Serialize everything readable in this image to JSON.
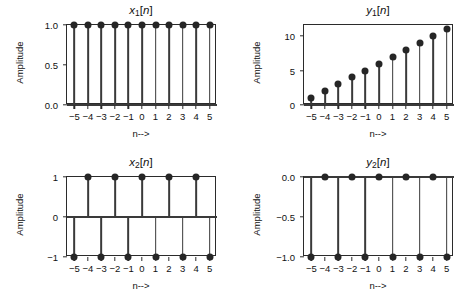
{
  "figure": {
    "width": 473,
    "height": 307,
    "background": "#ffffff",
    "line_color": "#3a3a3a",
    "marker_color": "#262626",
    "axis_color": "#2b2b2b"
  },
  "common": {
    "ylabel": "Amplitude",
    "xlabel": "n-->",
    "n_values": [
      -5,
      -4,
      -3,
      -2,
      -1,
      0,
      1,
      2,
      3,
      4,
      5
    ],
    "xtick_labels": [
      "−5",
      "−4",
      "−3",
      "−2",
      "−1",
      "0",
      "1",
      "2",
      "3",
      "4",
      "5"
    ]
  },
  "chart_data": [
    {
      "id": "x1",
      "type": "scatter",
      "subtype": "stem",
      "title": "x₁[n]",
      "title_base": "x",
      "title_sub": "1",
      "title_brackets": "[n]",
      "xlabel": "n-->",
      "ylabel": "Amplitude",
      "x": [
        -5,
        -4,
        -3,
        -2,
        -1,
        0,
        1,
        2,
        3,
        4,
        5
      ],
      "values": [
        1.0,
        1.0,
        1.0,
        1.0,
        1.0,
        1.0,
        1.0,
        1.0,
        1.0,
        1.0,
        1.0
      ],
      "xlim": [
        -5.55,
        5.55
      ],
      "ylim": [
        0.0,
        1.0
      ],
      "yticks": [
        0.0,
        0.5,
        1.0
      ],
      "ytick_labels": [
        "0.0",
        "0.5",
        "1.0"
      ],
      "baseline": 0.0,
      "grid": false,
      "legend": null
    },
    {
      "id": "y1",
      "type": "scatter",
      "subtype": "stem",
      "title": "y₁[n]",
      "title_base": "y",
      "title_sub": "1",
      "title_brackets": "[n]",
      "xlabel": "n-->",
      "ylabel": "Amplitude",
      "x": [
        -5,
        -4,
        -3,
        -2,
        -1,
        0,
        1,
        2,
        3,
        4,
        5
      ],
      "values": [
        1,
        2,
        3,
        4,
        5,
        6,
        7,
        8,
        9,
        10,
        11
      ],
      "xlim": [
        -5.55,
        5.55
      ],
      "ylim": [
        0,
        11.6
      ],
      "yticks": [
        0,
        5,
        10
      ],
      "ytick_labels": [
        "0",
        "5",
        "10"
      ],
      "baseline": 0,
      "grid": false,
      "legend": null
    },
    {
      "id": "x2",
      "type": "scatter",
      "subtype": "stem",
      "title": "x₂[n]",
      "title_base": "x",
      "title_sub": "2",
      "title_brackets": "[n]",
      "xlabel": "n-->",
      "ylabel": "Amplitude",
      "x": [
        -5,
        -4,
        -3,
        -2,
        -1,
        0,
        1,
        2,
        3,
        4,
        5
      ],
      "values": [
        -1,
        1,
        -1,
        1,
        -1,
        1,
        -1,
        1,
        -1,
        1,
        -1
      ],
      "xlim": [
        -5.55,
        5.55
      ],
      "ylim": [
        -1.0,
        1.0
      ],
      "yticks": [
        -1,
        0,
        1
      ],
      "ytick_labels": [
        "−1",
        "0",
        "1"
      ],
      "baseline": 0,
      "grid": false,
      "legend": null
    },
    {
      "id": "y2",
      "type": "scatter",
      "subtype": "stem",
      "title": "y₂[n]",
      "title_base": "y",
      "title_sub": "2",
      "title_brackets": "[n]",
      "xlabel": "n-->",
      "ylabel": "Amplitude",
      "x": [
        -5,
        -4,
        -3,
        -2,
        -1,
        0,
        1,
        2,
        3,
        4,
        5
      ],
      "values": [
        -1.0,
        0.0,
        -1.0,
        0.0,
        -1.0,
        0.0,
        -1.0,
        0.0,
        -1.0,
        0.0,
        -1.0
      ],
      "xlim": [
        -5.55,
        5.55
      ],
      "ylim": [
        -1.0,
        0.0
      ],
      "yticks": [
        -1.0,
        -0.5,
        0.0
      ],
      "ytick_labels": [
        "−1.0",
        "−0.5",
        "0.0"
      ],
      "baseline": 0.0,
      "grid": false,
      "legend": null
    }
  ]
}
